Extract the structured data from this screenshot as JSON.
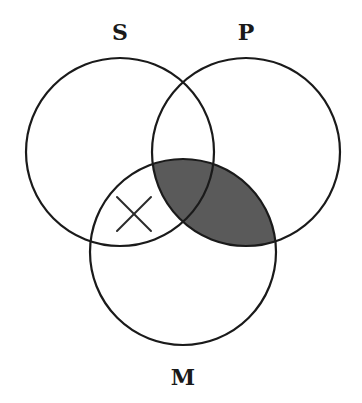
{
  "diagram": {
    "type": "venn-3",
    "colors": {
      "background": "#ffffff",
      "stroke": "#1a1a1a",
      "shade": "#5a5a5a"
    },
    "circles": [
      {
        "id": "S",
        "label": "S",
        "cx": 120,
        "cy": 152,
        "r": 94,
        "label_x": 120,
        "label_y": 40
      },
      {
        "id": "P",
        "label": "P",
        "cx": 246,
        "cy": 152,
        "r": 94,
        "label_x": 246,
        "label_y": 40
      },
      {
        "id": "M",
        "label": "M",
        "cx": 183,
        "cy": 252,
        "r": 93,
        "label_x": 183,
        "label_y": 385
      }
    ],
    "shaded_regions": [
      "P∩M"
    ],
    "marks": [
      {
        "type": "X",
        "region": "S∩M only",
        "cx": 134,
        "cy": 214,
        "size": 17
      }
    ]
  }
}
